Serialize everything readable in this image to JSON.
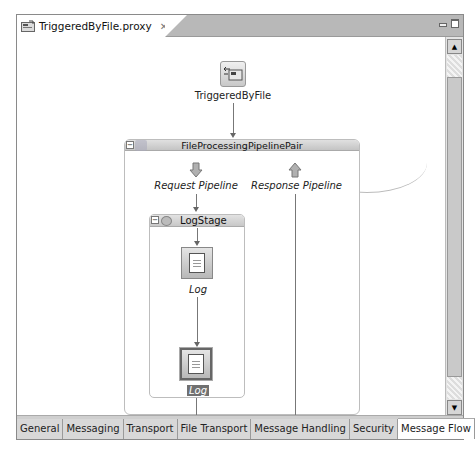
{
  "editor": {
    "tab": {
      "title": "TriggeredByFile.proxy",
      "icon": "proxy-service-icon",
      "close": "✕"
    },
    "window_controls": [
      "minimize",
      "maximize"
    ]
  },
  "diagram": {
    "proxy_service": {
      "label": "TriggeredByFile",
      "icon": "proxy-service-icon"
    },
    "pipeline_pair": {
      "label": "FileProcessingPipelinePair",
      "collapse": "−",
      "request_pipeline": {
        "label": "Request Pipeline",
        "icon": "arrow-down-icon"
      },
      "response_pipeline": {
        "label": "Response Pipeline",
        "icon": "arrow-up-icon"
      },
      "stage": {
        "label": "LogStage",
        "collapse": "−",
        "actions": [
          {
            "label": "Log",
            "selected": false
          },
          {
            "label": "Log",
            "selected": true
          }
        ]
      }
    }
  },
  "scrollbar": {
    "up": "▲",
    "down": "▼"
  },
  "bottom_tabs": [
    {
      "label": "General",
      "active": false
    },
    {
      "label": "Messaging",
      "active": false
    },
    {
      "label": "Transport",
      "active": false
    },
    {
      "label": "File Transport",
      "active": false
    },
    {
      "label": "Message Handling",
      "active": false
    },
    {
      "label": "Security",
      "active": false
    },
    {
      "label": "Message Flow",
      "active": true
    }
  ]
}
